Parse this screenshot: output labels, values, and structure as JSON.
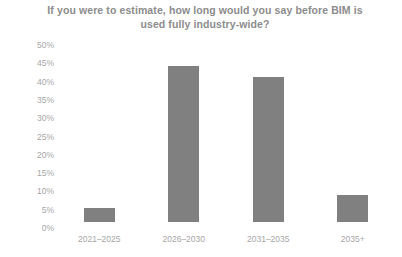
{
  "chart_data": {
    "type": "bar",
    "title": "If you were to estimate, how long would you say before BIM is used fully industry-wide?",
    "title_line1": "If you were to estimate, how long would you say before BIM is",
    "title_line2": "used fully industry-wide?",
    "categories": [
      "2021–2025",
      "2026–2030",
      "2031–2035",
      "2035+"
    ],
    "values": [
      4,
      45.5,
      42.5,
      8
    ],
    "value_labels": [
      "4%",
      "45.5%",
      "42.5%",
      "8%"
    ],
    "xlabel": "",
    "ylabel": "",
    "ylim": [
      0,
      50
    ],
    "ytick_step": 5,
    "ytick_labels": [
      "50%",
      "45%",
      "40%",
      "35%",
      "30%",
      "25%",
      "20%",
      "15%",
      "10%",
      "5%",
      "0%"
    ],
    "ytick_values": [
      50,
      45,
      40,
      35,
      30,
      25,
      20,
      15,
      10,
      5,
      0
    ],
    "grid": false,
    "legend": false,
    "legend_position": "none",
    "bar_color": "#808080",
    "background_color": "#ffffff",
    "title_color": "#8c8c8c",
    "tick_label_color": "#a6a6a6"
  }
}
